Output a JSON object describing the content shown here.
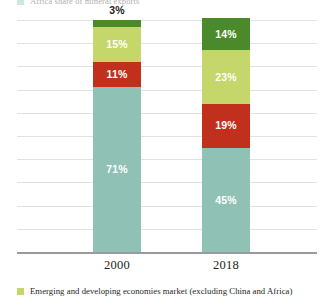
{
  "chart_data": {
    "type": "bar",
    "stacked": true,
    "normalized_percent": true,
    "title": "",
    "subtitle": "",
    "xlabel": "",
    "ylabel": "",
    "categories": [
      "2000",
      "2018"
    ],
    "ylim": [
      0,
      100
    ],
    "grid": true,
    "gridline_count": 10,
    "y_tick_labels": [],
    "legend_position": "bottom",
    "series": [
      {
        "name": "Emerging and developing economies market (excluding China and Africa)",
        "color": "#c5d66b",
        "values": [
          15,
          23
        ],
        "labels": [
          "15%",
          "23%"
        ],
        "label_position": "inside"
      },
      {
        "name": "",
        "color": "#4a8a2a",
        "values": [
          3,
          14
        ],
        "labels": [
          "3%",
          "14%"
        ],
        "label_position": "mixed"
      },
      {
        "name": "",
        "color": "#c0301c",
        "values": [
          11,
          19
        ],
        "labels": [
          "11%",
          "19%"
        ],
        "label_position": "inside"
      },
      {
        "name": "",
        "color": "#8fc2b4",
        "values": [
          71,
          45
        ],
        "labels": [
          "71%",
          "45%"
        ],
        "label_position": "inside"
      }
    ],
    "stack_order_bottom_to_top": [
      "teal",
      "red",
      "light-green",
      "dark-green"
    ],
    "bars": [
      {
        "category": "2000",
        "segments": [
          {
            "key": "teal",
            "color": "#8fc2b4",
            "value": 71,
            "label": "71%",
            "label_inside": true
          },
          {
            "key": "red",
            "color": "#c0301c",
            "value": 11,
            "label": "11%",
            "label_inside": true
          },
          {
            "key": "light-green",
            "color": "#c5d66b",
            "value": 15,
            "label": "15%",
            "label_inside": true
          },
          {
            "key": "dark-green",
            "color": "#4a8a2a",
            "value": 3,
            "label": "3%",
            "label_inside": false
          }
        ]
      },
      {
        "category": "2018",
        "segments": [
          {
            "key": "teal",
            "color": "#8fc2b4",
            "value": 45,
            "label": "45%",
            "label_inside": true
          },
          {
            "key": "red",
            "color": "#c0301c",
            "value": 19,
            "label": "19%",
            "label_inside": true
          },
          {
            "key": "light-green",
            "color": "#c5d66b",
            "value": 23,
            "label": "23%",
            "label_inside": true
          },
          {
            "key": "dark-green",
            "color": "#4a8a2a",
            "value": 14,
            "label": "14%",
            "label_inside": true
          }
        ]
      }
    ]
  },
  "legend": {
    "swatch_color": "#c5d66b",
    "label": "Emerging and developing economies market (excluding China and Africa)"
  },
  "clipped_top_legend": {
    "swatch_color": "#8fc2b4",
    "label": "Africa share of mineral exports"
  },
  "axis": {
    "category_labels": [
      "2000",
      "2018"
    ]
  },
  "colors": {
    "teal": "#8fc2b4",
    "red": "#c0301c",
    "light_green": "#c5d66b",
    "dark_green": "#4a8a2a",
    "gridline": "#e2e2e2",
    "baseline": "#9a9a9a",
    "text": "#231f20",
    "background": "#ffffff"
  }
}
